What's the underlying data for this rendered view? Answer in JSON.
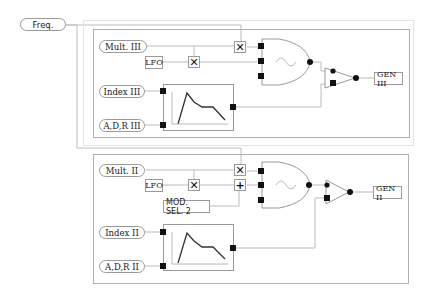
{
  "freq": {
    "label": "Freq."
  },
  "panels": [
    {
      "id": "gen3",
      "mult_label": "Mult. III",
      "lfo_label": "LFO",
      "index_label": "Index III",
      "adr_label": "A,D,R III",
      "output_label": "GEN III",
      "mult_op": "✕",
      "lfo_op": "✕"
    },
    {
      "id": "gen2",
      "mult_label": "Mult. II",
      "lfo_label": "LFO",
      "mod_sel_label": "MOD. SEL. 2",
      "index_label": "Index II",
      "adr_label": "A,D,R II",
      "output_label": "GEN II",
      "mult_op": "✕",
      "add_op": "+",
      "lfo_op": "✕"
    }
  ],
  "colors": {
    "line": "#b4b4b4",
    "panel_border": "#b0b0b0",
    "node": "#111111"
  }
}
